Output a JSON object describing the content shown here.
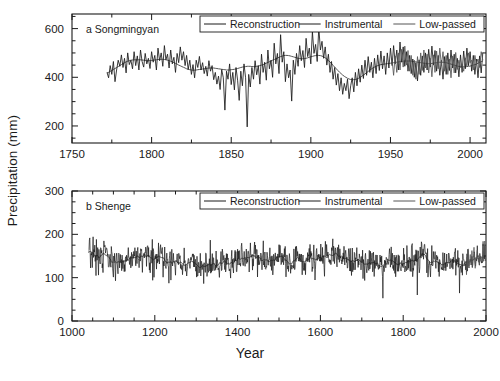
{
  "figure": {
    "xlabel": "Year",
    "ylabel": "Precipitation (mm)",
    "background": "#ffffff",
    "line_color": "#1a1a1a",
    "lowpass_color": "#555555"
  },
  "chart_data": [
    {
      "type": "line",
      "panel": "a",
      "title": "a Songmingyan",
      "xlabel": "",
      "ylabel": "Precipitation (mm)",
      "xlim": [
        1750,
        2010
      ],
      "ylim": [
        130,
        660
      ],
      "xticks": [
        1750,
        1800,
        1850,
        1900,
        1950,
        2000
      ],
      "yticks": [
        200,
        400,
        600
      ],
      "xminor_interval": 25,
      "yminor_interval": 50,
      "grid": false,
      "legend_position": "top-right",
      "legend": [
        "Reconstruction",
        "Instrumental",
        "Low-passed"
      ],
      "series": [
        {
          "name": "Reconstruction",
          "x_start": 1772,
          "x_end": 2008,
          "values": [
            420,
            398,
            448,
            412,
            465,
            382,
            430,
            470,
            445,
            492,
            440,
            478,
            418,
            500,
            452,
            470,
            435,
            505,
            448,
            488,
            430,
            512,
            465,
            442,
            498,
            455,
            478,
            436,
            505,
            462,
            490,
            430,
            520,
            468,
            500,
            445,
            530,
            472,
            495,
            438,
            512,
            455,
            482,
            420,
            498,
            460,
            525,
            470,
            505,
            448,
            490,
            432,
            470,
            412,
            452,
            398,
            470,
            440,
            486,
            430,
            460,
            415,
            445,
            405,
            468,
            425,
            448,
            390,
            420,
            372,
            405,
            350,
            432,
            398,
            265,
            425,
            392,
            455,
            370,
            420,
            348,
            440,
            388,
            305,
            425,
            365,
            455,
            398,
            196,
            412,
            360,
            440,
            392,
            468,
            410,
            448,
            372,
            495,
            420,
            462,
            388,
            512,
            435,
            470,
            400,
            540,
            455,
            498,
            415,
            575,
            462,
            505,
            382,
            455,
            398,
            430,
            302,
            470,
            412,
            498,
            445,
            530,
            468,
            510,
            440,
            560,
            485,
            520,
            455,
            588,
            498,
            535,
            465,
            605,
            512,
            548,
            478,
            525,
            450,
            495,
            420,
            465,
            392,
            440,
            368,
            415,
            345,
            398,
            330,
            375,
            345,
            392,
            312,
            365,
            398,
            340,
            420,
            365,
            435,
            380,
            450,
            395,
            470,
            408,
            485,
            420,
            462,
            398,
            478,
            415,
            492,
            428,
            508,
            435,
            488,
            412,
            500,
            438,
            520,
            448,
            530,
            455,
            512,
            430,
            545,
            462,
            525,
            445,
            505,
            425,
            490,
            415,
            475,
            400,
            460,
            385,
            472,
            408,
            488,
            420,
            500,
            430,
            515,
            442,
            528,
            450,
            510,
            425,
            490,
            408,
            470,
            392,
            485,
            412,
            500,
            428,
            512,
            438,
            495,
            418,
            478,
            402,
            492,
            420,
            508,
            435,
            520,
            448,
            505,
            425,
            490,
            412,
            475,
            398,
            488,
            418,
            502,
            432
          ]
        },
        {
          "name": "Instrumental",
          "x_start": 1951,
          "x_end": 2008,
          "values": [
            470,
            408,
            488,
            420,
            500,
            430,
            515,
            442,
            528,
            450,
            510,
            425,
            490,
            408,
            470,
            392,
            485,
            412,
            500,
            428,
            512,
            438,
            495,
            418,
            478,
            402,
            492,
            420,
            508,
            435,
            520,
            448,
            505,
            425,
            490,
            412,
            475,
            398,
            488,
            418,
            502,
            432,
            470,
            440,
            455,
            425,
            480,
            445,
            500,
            460,
            470,
            430,
            490,
            455,
            475,
            440,
            505,
            470
          ]
        },
        {
          "name": "Low-passed",
          "x_start": 1772,
          "x_end": 2008,
          "values": [
            418,
            420,
            424,
            428,
            432,
            436,
            440,
            444,
            448,
            452,
            456,
            460,
            463,
            466,
            468,
            470,
            471,
            472,
            472,
            472,
            472,
            472,
            471,
            470,
            469,
            468,
            468,
            468,
            469,
            470,
            471,
            472,
            473,
            474,
            474,
            474,
            473,
            472,
            470,
            468,
            466,
            463,
            460,
            457,
            454,
            450,
            447,
            444,
            441,
            438,
            435,
            433,
            431,
            430,
            429,
            429,
            430,
            431,
            432,
            433,
            434,
            435,
            436,
            437,
            438,
            438,
            438,
            438,
            437,
            436,
            435,
            434,
            433,
            432,
            431,
            430,
            430,
            430,
            431,
            432,
            433,
            434,
            436,
            438,
            440,
            442,
            443,
            444,
            445,
            445,
            445,
            444,
            444,
            444,
            445,
            446,
            448,
            450,
            452,
            455,
            458,
            461,
            464,
            467,
            470,
            473,
            476,
            479,
            482,
            485,
            487,
            489,
            490,
            490,
            489,
            488,
            486,
            484,
            482,
            480,
            478,
            477,
            476,
            476,
            477,
            478,
            480,
            482,
            484,
            486,
            488,
            489,
            490,
            490,
            489,
            487,
            484,
            480,
            475,
            469,
            463,
            456,
            449,
            442,
            435,
            428,
            421,
            415,
            409,
            404,
            400,
            396,
            393,
            391,
            390,
            390,
            391,
            393,
            396,
            400,
            404,
            409,
            414,
            419,
            424,
            429,
            434,
            438,
            442,
            445,
            448,
            450,
            452,
            453,
            454,
            455,
            456,
            457,
            458,
            459,
            460,
            461,
            462,
            463,
            464,
            465,
            466,
            467,
            467,
            467,
            467,
            466,
            465,
            464,
            463,
            462,
            461,
            460,
            459,
            458,
            457,
            456,
            456,
            456,
            457,
            458,
            459,
            460,
            461,
            462,
            462,
            462,
            461,
            460,
            458,
            456,
            454,
            452,
            450,
            448,
            446,
            445,
            444,
            443,
            443,
            443,
            444,
            445,
            446,
            448,
            450,
            452,
            455,
            458,
            461,
            464,
            467,
            470
          ]
        }
      ]
    },
    {
      "type": "line",
      "panel": "b",
      "title": "b Shenge",
      "xlabel": "Year",
      "ylabel": "Precipitation (mm)",
      "xlim": [
        1000,
        2000
      ],
      "ylim": [
        0,
        300
      ],
      "xticks": [
        1000,
        1200,
        1400,
        1600,
        1800,
        2000
      ],
      "yticks": [
        0,
        100,
        200,
        300
      ],
      "xminor_interval": 50,
      "yminor_interval": 25,
      "grid": false,
      "legend_position": "top-right",
      "legend": [
        "Reconstruction",
        "Instrumental",
        "Low-passed"
      ],
      "series": [
        {
          "name": "Reconstruction",
          "x_start": 1040,
          "x_end": 1998,
          "mean": 140,
          "std": 28,
          "min": 20,
          "max": 218,
          "note": "dense annual series, ~959 points"
        },
        {
          "name": "Instrumental",
          "x_start": 1951,
          "x_end": 1998,
          "mean": 150,
          "std": 30
        },
        {
          "name": "Low-passed",
          "x_start": 1040,
          "x_end": 1998,
          "mean": 140,
          "std": 9
        }
      ]
    }
  ]
}
